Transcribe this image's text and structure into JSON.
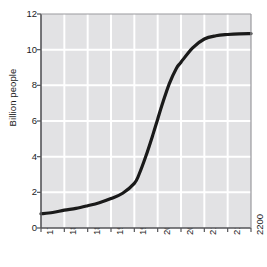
{
  "chart_data": {
    "type": "line",
    "title": "",
    "subtitle": "",
    "xlabel": "",
    "ylabel": "Billion people",
    "xlim": [
      1750,
      2200
    ],
    "ylim": [
      0,
      12
    ],
    "grid": true,
    "legend": "none",
    "x_ticks": [
      "1750",
      "1800",
      "1850",
      "1900",
      "1950",
      "2000",
      "2050",
      "2100",
      "2150",
      "2200"
    ],
    "y_ticks": [
      "0",
      "2",
      "4",
      "6",
      "8",
      "10",
      "12"
    ],
    "x": [
      1750,
      1800,
      1850,
      1900,
      1950,
      2000,
      2050,
      2100,
      2150,
      2200
    ],
    "series": [
      {
        "name": "World population",
        "values": [
          0.8,
          1.0,
          1.25,
          1.65,
          2.5,
          6.1,
          9.3,
          10.6,
          10.85,
          10.9
        ]
      }
    ],
    "points": [
      {
        "x": 1750,
        "y": 0.8
      },
      {
        "x": 1775,
        "y": 0.87
      },
      {
        "x": 1800,
        "y": 1.0
      },
      {
        "x": 1825,
        "y": 1.1
      },
      {
        "x": 1850,
        "y": 1.25
      },
      {
        "x": 1875,
        "y": 1.42
      },
      {
        "x": 1900,
        "y": 1.65
      },
      {
        "x": 1925,
        "y": 1.95
      },
      {
        "x": 1950,
        "y": 2.5
      },
      {
        "x": 1960,
        "y": 3.0
      },
      {
        "x": 1975,
        "y": 4.05
      },
      {
        "x": 1990,
        "y": 5.25
      },
      {
        "x": 2000,
        "y": 6.1
      },
      {
        "x": 2010,
        "y": 6.95
      },
      {
        "x": 2025,
        "y": 8.1
      },
      {
        "x": 2040,
        "y": 8.95
      },
      {
        "x": 2050,
        "y": 9.3
      },
      {
        "x": 2075,
        "y": 10.1
      },
      {
        "x": 2100,
        "y": 10.6
      },
      {
        "x": 2125,
        "y": 10.78
      },
      {
        "x": 2150,
        "y": 10.85
      },
      {
        "x": 2175,
        "y": 10.89
      },
      {
        "x": 2200,
        "y": 10.9
      }
    ],
    "colors": {
      "plot_background": "#e2e2e4",
      "gridline": "#ffffff",
      "axis": "#555558",
      "line": "#1a1a1a",
      "text": "#1b1b1b",
      "page_background": "#ffffff"
    },
    "line_width": 3.2
  }
}
